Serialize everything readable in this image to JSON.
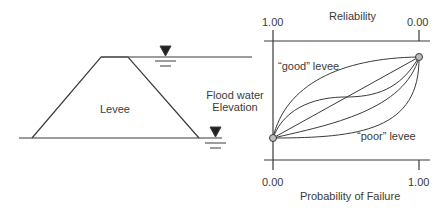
{
  "levee_diagram": {
    "levee_label": "Levee",
    "flood_label_line1": "Flood water",
    "flood_label_line2": "Elevation",
    "water_marker_icon": "water-level-triangle"
  },
  "chart": {
    "top_axis_title": "Reliability",
    "top_axis_left_tick": "1.00",
    "top_axis_right_tick": "0.00",
    "bottom_axis_title": "Probability of Failure",
    "bottom_axis_left_tick": "0.00",
    "bottom_axis_right_tick": "1.00",
    "good_curve_label": "“good” levee",
    "poor_curve_label": "“poor” levee"
  },
  "colors": {
    "line": "#3a3a3a",
    "point_fill": "#bdbdbd"
  }
}
